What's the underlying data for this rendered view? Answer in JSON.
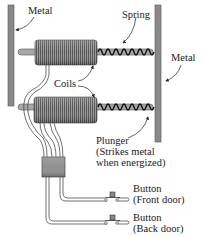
{
  "diagram": {
    "type": "electric doorbell / chime mechanism",
    "labels": {
      "metal_left": "Metal",
      "metal_right": "Metal",
      "spring": "Spring",
      "coils": "Coils",
      "plunger_line1": "Plunger",
      "plunger_line2": "(Strikes metal",
      "plunger_line3": "when energized)",
      "button_front_line1": "Button",
      "button_front_line2": "(Front door)",
      "button_back_line1": "Button",
      "button_back_line2": "(Back door)"
    },
    "components": [
      {
        "name": "Metal",
        "role": "left striker plate"
      },
      {
        "name": "Metal",
        "role": "right striker plate"
      },
      {
        "name": "Coils",
        "count": 2
      },
      {
        "name": "Spring",
        "count": 2
      },
      {
        "name": "Plunger",
        "note": "Strikes metal when energized"
      },
      {
        "name": "Junction box"
      },
      {
        "name": "Button",
        "location": "Front door"
      },
      {
        "name": "Button",
        "location": "Back door"
      }
    ],
    "colors": {
      "metal": "#8a8a8a",
      "coil": "#7a7a7a",
      "wire": "#333333",
      "box": "#909090",
      "text": "#1a1a1a"
    }
  }
}
